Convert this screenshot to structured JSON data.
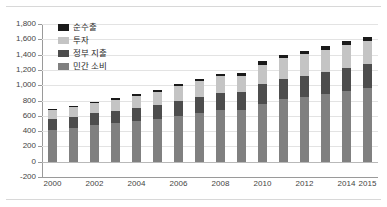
{
  "chart_data": {
    "type": "bar",
    "stacked": true,
    "title": "",
    "subtitle": "",
    "xlabel": "",
    "ylabel": "",
    "ylim": [
      -200,
      1800
    ],
    "ytick_step": 200,
    "ytick_labels": [
      "1,800",
      "1,600",
      "1,400",
      "1,200",
      "1,000",
      "800",
      "600",
      "400",
      "200",
      "0",
      "-200"
    ],
    "ytick_values": [
      1800,
      1600,
      1400,
      1200,
      1000,
      800,
      600,
      400,
      200,
      0,
      -200
    ],
    "grid": true,
    "legend_position": "upper-left",
    "categories": [
      2000,
      2001,
      2002,
      2003,
      2004,
      2005,
      2006,
      2007,
      2008,
      2009,
      2010,
      2011,
      2012,
      2013,
      2014,
      2015
    ],
    "xtick_labels": [
      "2000",
      "2002",
      "2004",
      "2006",
      "2008",
      "2010",
      "2012",
      "2014",
      "2015"
    ],
    "xtick_categories": [
      2000,
      2002,
      2004,
      2006,
      2008,
      2010,
      2012,
      2014,
      2015
    ],
    "series": [
      {
        "name": "민간 소비",
        "key": "consumption",
        "color": "#808080",
        "values": [
          420,
          440,
          480,
          500,
          530,
          560,
          600,
          640,
          680,
          680,
          760,
          820,
          850,
          880,
          920,
          960
        ]
      },
      {
        "name": "정부 지출",
        "key": "government",
        "color": "#4d4d4d",
        "values": [
          140,
          145,
          155,
          160,
          170,
          180,
          195,
          205,
          220,
          230,
          250,
          265,
          275,
          290,
          300,
          315
        ]
      },
      {
        "name": "투자",
        "key": "investment",
        "color": "#c4c4c4",
        "values": [
          115,
          125,
          135,
          150,
          160,
          175,
          190,
          215,
          225,
          205,
          255,
          270,
          280,
          290,
          305,
          300
        ]
      },
      {
        "name": "순수출",
        "key": "netexports",
        "color": "#1a1a1a",
        "values": [
          10,
          12,
          15,
          18,
          22,
          25,
          25,
          25,
          20,
          40,
          45,
          35,
          45,
          55,
          55,
          60
        ]
      }
    ],
    "totals": [
      685,
      722,
      785,
      828,
      882,
      940,
      1010,
      1085,
      1145,
      1155,
      1310,
      1390,
      1450,
      1515,
      1580,
      1635
    ]
  },
  "legend": {
    "items": [
      {
        "label": "순수출",
        "key": "netexports"
      },
      {
        "label": "투자",
        "key": "investment"
      },
      {
        "label": "정부 지출",
        "key": "government"
      },
      {
        "label": "민간 소비",
        "key": "consumption"
      }
    ]
  },
  "colors": {
    "consumption": "#808080",
    "government": "#4d4d4d",
    "investment": "#c4c4c4",
    "netexports": "#1a1a1a",
    "grid": "#e3e3e3",
    "axis": "#9a9a9a",
    "rule": "#d8d8d8",
    "background": "#ffffff"
  }
}
